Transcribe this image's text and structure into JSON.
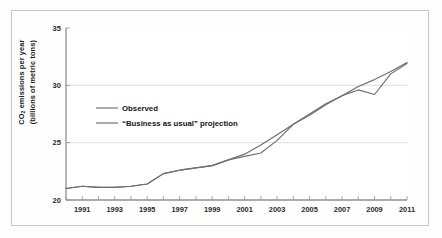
{
  "chart_data": {
    "type": "line",
    "title": "",
    "xlabel": "",
    "ylabel_line1": "CO2 emissions per year",
    "ylabel_line2": "(billions of metric tons)",
    "xlim": [
      1990,
      2011
    ],
    "ylim": [
      20,
      35
    ],
    "yticks": [
      20,
      25,
      30,
      35
    ],
    "ytick_labels": [
      "20",
      "25",
      "30",
      "35"
    ],
    "xticks": [
      1991,
      1993,
      1995,
      1997,
      1999,
      2001,
      2003,
      2005,
      2007,
      2009,
      2011
    ],
    "xtick_labels": [
      "1991",
      "1993",
      "1995",
      "1997",
      "1999",
      "2001",
      "2003",
      "2005",
      "2007",
      "2009",
      "2011"
    ],
    "x_minor_ticks": [
      1990,
      1992,
      1994,
      1996,
      1998,
      2000,
      2002,
      2004,
      2006,
      2008,
      2010
    ],
    "grid": "horizontal-only",
    "gridlines_at": [
      25,
      30
    ],
    "legend_position": "upper-left-inside",
    "line_color": "#6e6e6e",
    "grid_color": "#d8d8d8",
    "axis_color": "#8a8a8a",
    "x": [
      1990,
      1991,
      1992,
      1993,
      1994,
      1995,
      1996,
      1997,
      1998,
      1999,
      2000,
      2001,
      2002,
      2003,
      2004,
      2005,
      2006,
      2007,
      2008,
      2009,
      2010,
      2011
    ],
    "series": [
      {
        "name": "Observed",
        "label": "Observed",
        "values": [
          21.0,
          21.2,
          21.1,
          21.1,
          21.2,
          21.4,
          22.3,
          22.6,
          22.8,
          23.0,
          23.5,
          23.8,
          24.1,
          25.2,
          26.6,
          27.5,
          28.4,
          29.1,
          29.6,
          29.2,
          31.0,
          31.9
        ]
      },
      {
        "name": "Business as usual projection",
        "label": "“Business as usual” projection",
        "values": [
          21.0,
          21.2,
          21.1,
          21.1,
          21.2,
          21.4,
          22.3,
          22.6,
          22.8,
          23.0,
          23.5,
          24.0,
          24.8,
          25.7,
          26.6,
          27.4,
          28.3,
          29.1,
          29.9,
          30.5,
          31.2,
          32.0
        ]
      }
    ]
  },
  "legend": {
    "observed_label": "Observed",
    "projection_label": "“Business as usual” projection"
  },
  "axes": {
    "y_title_line1_prefix": "CO",
    "y_title_line1_sub": "2",
    "y_title_line1_suffix": " emissions per year",
    "y_title_line2": "(billions of metric tons)"
  }
}
